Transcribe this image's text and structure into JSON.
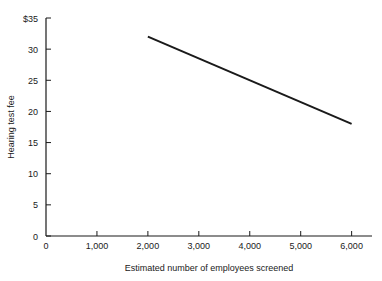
{
  "chart_data": {
    "type": "line",
    "title": "",
    "xlabel": "Estimated number of employees screened",
    "ylabel": "Hearing test fee",
    "xlim": [
      0,
      6400
    ],
    "ylim": [
      0,
      35
    ],
    "grid": false,
    "legend": "none",
    "x_ticks": [
      {
        "value": 0,
        "label": "0"
      },
      {
        "value": 1000,
        "label": "1,000"
      },
      {
        "value": 2000,
        "label": "2,000"
      },
      {
        "value": 3000,
        "label": "3,000"
      },
      {
        "value": 4000,
        "label": "4,000"
      },
      {
        "value": 5000,
        "label": "5,000"
      },
      {
        "value": 6000,
        "label": "6,000"
      }
    ],
    "y_ticks": [
      {
        "value": 0,
        "label": "0"
      },
      {
        "value": 5,
        "label": "5"
      },
      {
        "value": 10,
        "label": "10"
      },
      {
        "value": 15,
        "label": "15"
      },
      {
        "value": 20,
        "label": "20"
      },
      {
        "value": 25,
        "label": "25"
      },
      {
        "value": 30,
        "label": "30"
      },
      {
        "value": 35,
        "label": "$35"
      }
    ],
    "series": [
      {
        "name": "Hearing test fee",
        "color": "#1a1a1a",
        "x": [
          2000,
          6000
        ],
        "values": [
          32,
          18
        ]
      }
    ],
    "axis_color": "#1a1a1a",
    "background_color": "#ffffff"
  }
}
